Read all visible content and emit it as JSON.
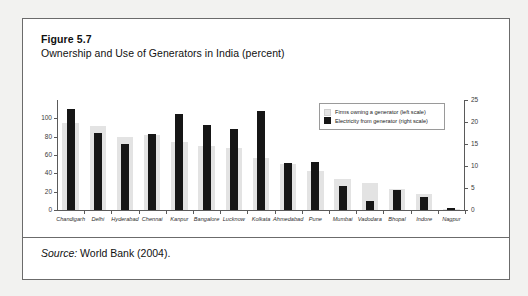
{
  "figure": {
    "label": "Figure 5.7",
    "title": "Ownership and Use of Generators in India (percent)",
    "source_prefix": "Source:",
    "source_text": " World Bank (2004)."
  },
  "legend": {
    "position": "top-right",
    "items": [
      {
        "swatch": "gray",
        "label": "Firms owning a generator (left scale)"
      },
      {
        "swatch": "black",
        "label": "Electricity from generator (right scale)"
      }
    ]
  },
  "axes": {
    "left_ticks": [
      "0",
      "20",
      "40",
      "60",
      "80",
      "100"
    ],
    "right_ticks": [
      "0",
      "5",
      "10",
      "15",
      "20",
      "25"
    ]
  },
  "colors": {
    "gray_bar": "#e3e3e3",
    "black_bar": "#161616",
    "axis": "#5a5a5a",
    "frame": "#6b6b6b",
    "page_bg": "#f2f2f0"
  },
  "chart_data": {
    "type": "bar",
    "title": "Ownership and Use of Generators in India (percent)",
    "xlabel": "",
    "ylabel": "",
    "grid": false,
    "legend_position": "top-right",
    "dual_axis": true,
    "ylim": [
      0,
      120
    ],
    "ylim_right": [
      0,
      25
    ],
    "yticks": [
      0,
      20,
      40,
      60,
      80,
      100
    ],
    "yticks_right": [
      0,
      5,
      10,
      15,
      20,
      25
    ],
    "categories": [
      "Chandigarh",
      "Delhi",
      "Hyderabad",
      "Chennai",
      "Kanpur",
      "Bangalore",
      "Lucknow",
      "Kolkata",
      "Ahmedabad",
      "Pune",
      "Mumbai",
      "Vadodara",
      "Bhopal",
      "Indore",
      "Nagpur"
    ],
    "series": [
      {
        "name": "Firms owning a generator (left scale)",
        "axis": "left",
        "color": "#e3e3e3",
        "values": [
          95,
          92,
          80,
          82,
          74,
          70,
          68,
          57,
          50,
          43,
          34,
          30,
          23,
          17,
          1
        ]
      },
      {
        "name": "Electricity from generator (right scale)",
        "axis": "right",
        "color": "#161616",
        "values": [
          23.0,
          17.5,
          15.0,
          17.2,
          21.8,
          19.4,
          18.5,
          22.4,
          10.6,
          10.9,
          5.5,
          2.1,
          4.6,
          3.0,
          0.4
        ]
      }
    ]
  }
}
